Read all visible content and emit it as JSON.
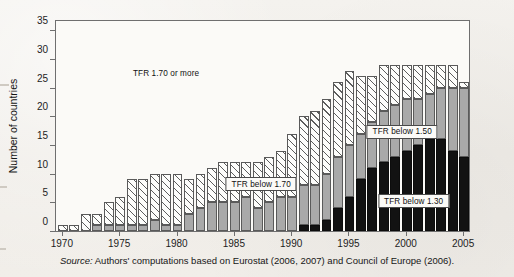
{
  "figure": {
    "caption_prefix": "Source:",
    "caption_text": " Authors' computations based on Eurostat (2006, 2007) and Council of Europe (2006)."
  },
  "chart_data": {
    "type": "bar",
    "title": "",
    "subtitle": "",
    "xlabel": "",
    "ylabel": "Number of countries",
    "stacked": true,
    "grid": false,
    "legend_position": "inside-annotations",
    "xlim": [
      1969.4,
      2005.6
    ],
    "ylim": [
      0,
      37
    ],
    "yticks": [
      0,
      5,
      10,
      15,
      20,
      25,
      30,
      35
    ],
    "xticks": [
      1970,
      1975,
      1980,
      1985,
      1990,
      1995,
      2000,
      2005
    ],
    "xtick_labels": [
      "1970",
      "1975",
      "1980",
      "1985",
      "1990",
      "1995",
      "2000",
      "2005"
    ],
    "ytick_labels": [
      "0",
      "5",
      "10",
      "15",
      "20",
      "25",
      "30",
      "35"
    ],
    "categories": [
      1970,
      1971,
      1972,
      1973,
      1974,
      1975,
      1976,
      1977,
      1978,
      1979,
      1980,
      1981,
      1982,
      1983,
      1984,
      1985,
      1986,
      1987,
      1988,
      1989,
      1990,
      1991,
      1992,
      1993,
      1994,
      1995,
      1996,
      1997,
      1998,
      1999,
      2000,
      2001,
      2002,
      2003,
      2004,
      2005
    ],
    "series": [
      {
        "name": "TFR below 1.30",
        "color": "#121212",
        "pattern": "solid-black",
        "values": [
          0,
          0,
          0,
          0,
          0,
          0,
          0,
          0,
          0,
          0,
          0,
          0,
          0,
          0,
          0,
          0,
          0,
          0,
          0,
          0,
          0,
          1,
          1,
          2,
          4,
          6,
          9,
          11,
          12,
          13,
          14,
          15,
          16,
          16,
          14,
          13
        ]
      },
      {
        "name": "TFR below 1.50",
        "color": "#a9a9a9",
        "pattern": "solid-gray",
        "values": [
          0,
          0,
          0,
          1,
          1,
          1,
          1,
          1,
          2,
          1,
          1,
          3,
          4,
          5,
          5,
          5,
          6,
          4,
          5,
          6,
          6,
          7,
          7,
          8,
          9,
          9,
          8,
          8,
          9,
          9,
          9,
          8,
          8,
          9,
          11,
          12
        ]
      },
      {
        "name": "TFR below 1.70",
        "color": "#fdfdfb",
        "pattern": "diagonal-hatch",
        "values": [
          1,
          1,
          3,
          2,
          4,
          5,
          8,
          8,
          8,
          9,
          9,
          6,
          6,
          6,
          7,
          7,
          6,
          8,
          8,
          8,
          11,
          12,
          13,
          13,
          13,
          13,
          10,
          8,
          8,
          7,
          6,
          6,
          5,
          4,
          4,
          1
        ]
      }
    ],
    "annotations": [
      {
        "text": "TFR 1.70 or more",
        "boxed": false,
        "x_year": 1979.0,
        "y_value": 27.5
      },
      {
        "text": "TFR below 1.70",
        "boxed": true,
        "x_year": 1987.3,
        "y_value": 8.2
      },
      {
        "text": "TFR below 1.50",
        "boxed": true,
        "x_year": 1999.6,
        "y_value": 17.3
      },
      {
        "text": "TFR below 1.30",
        "boxed": true,
        "x_year": 2000.6,
        "y_value": 5.2
      }
    ]
  }
}
